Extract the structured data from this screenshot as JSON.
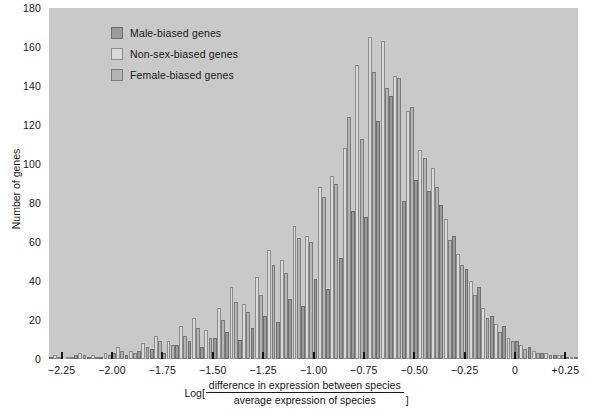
{
  "chart": {
    "type": "bar",
    "title": "",
    "y_axis_label": "Number of genes",
    "x_axis_caption": {
      "log_open": "Log[",
      "numerator": "difference in expression between species",
      "denominator": "average expression of species",
      "bracket_close": "]"
    },
    "legend_position": "top-left",
    "plot_background": "#c9c9c9",
    "page_background": "#ffffff"
  },
  "legend": {
    "items": [
      {
        "label": "Male-biased genes",
        "color": "#9a9a9a",
        "border": "#6f6f6f"
      },
      {
        "label": "Non-sex-biased genes",
        "color": "#d9d9d9",
        "border": "#8d8d8d"
      },
      {
        "label": "Female-biased genes",
        "color": "#b4b4b4",
        "border": "#7c7c7c"
      }
    ]
  },
  "chart_data": {
    "type": "bar",
    "title": "",
    "xlabel": "Log[ difference in expression between species / average expression of species ]",
    "ylabel": "Number of genes",
    "ylim": [
      0,
      180
    ],
    "xlim": [
      -2.3125,
      0.3125
    ],
    "grid": false,
    "legend": [
      "Male-biased genes",
      "Non-sex-biased genes",
      "Female-biased genes"
    ],
    "yticks": [
      0,
      20,
      40,
      60,
      80,
      100,
      120,
      140,
      160,
      180
    ],
    "xticks": [
      -2.25,
      -2.0,
      -1.75,
      -1.5,
      -1.25,
      -1.0,
      -0.75,
      -0.5,
      -0.25,
      0,
      0.25
    ],
    "xticklabels": [
      "−2.25",
      "−2.00",
      "−1.75",
      "−1.50",
      "−1.25",
      "−1.00",
      "−0.75",
      "−0.50",
      "−0.25",
      "0",
      "+0.25"
    ],
    "bin_width": 0.0625,
    "bin_centers": [
      -2.28125,
      -2.21875,
      -2.15625,
      -2.09375,
      -2.03125,
      -1.96875,
      -1.90625,
      -1.84375,
      -1.78125,
      -1.71875,
      -1.65625,
      -1.59375,
      -1.53125,
      -1.46875,
      -1.40625,
      -1.34375,
      -1.28125,
      -1.21875,
      -1.15625,
      -1.09375,
      -1.03125,
      -0.96875,
      -0.90625,
      -0.84375,
      -0.78125,
      -0.71875,
      -0.65625,
      -0.59375,
      -0.53125,
      -0.46875,
      -0.40625,
      -0.34375,
      -0.28125,
      -0.21875,
      -0.15625,
      -0.09375,
      -0.03125,
      0.03125,
      0.09375,
      0.15625,
      0.21875,
      0.28125
    ],
    "series": [
      {
        "name": "Male-biased genes",
        "color": "#9a9a9a",
        "values": [
          1,
          0,
          2,
          1,
          1,
          3,
          2,
          4,
          5,
          3,
          7,
          9,
          6,
          11,
          14,
          10,
          16,
          22,
          19,
          31,
          27,
          41,
          36,
          52,
          76,
          73,
          122,
          135,
          81,
          92,
          86,
          79,
          63,
          46,
          37,
          22,
          17,
          9,
          6,
          3,
          2,
          1
        ]
      },
      {
        "name": "Non-sex-biased genes",
        "color": "#d9d9d9",
        "values": [
          2,
          1,
          3,
          2,
          3,
          6,
          4,
          8,
          12,
          9,
          17,
          21,
          15,
          26,
          37,
          28,
          42,
          56,
          51,
          68,
          63,
          88,
          94,
          108,
          151,
          165,
          163,
          145,
          127,
          107,
          98,
          72,
          54,
          40,
          26,
          18,
          11,
          7,
          4,
          3,
          2,
          1
        ]
      },
      {
        "name": "Female-biased genes",
        "color": "#b4b4b4",
        "values": [
          1,
          1,
          2,
          1,
          2,
          4,
          3,
          6,
          9,
          7,
          12,
          16,
          11,
          20,
          29,
          24,
          33,
          48,
          44,
          62,
          60,
          83,
          90,
          124,
          113,
          147,
          139,
          144,
          129,
          103,
          88,
          61,
          48,
          33,
          21,
          14,
          9,
          5,
          3,
          2,
          2,
          1
        ]
      }
    ]
  }
}
